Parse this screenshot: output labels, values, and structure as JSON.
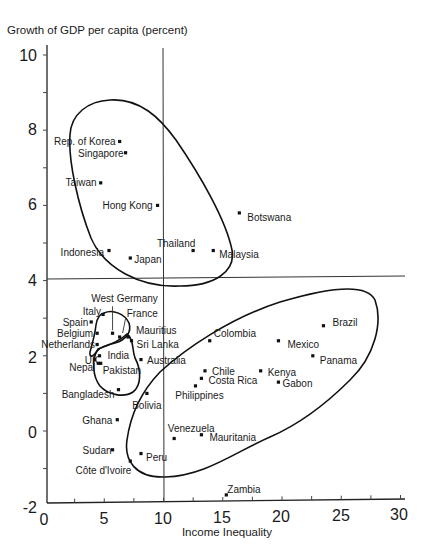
{
  "chart_data": {
    "type": "scatter",
    "title": "Growth of GDP per capita (percent)",
    "xlabel": "Income Inequality",
    "ylabel": "Growth of GDP per capita (percent)",
    "xlim": [
      0,
      30
    ],
    "ylim": [
      -2,
      10
    ],
    "xticks": [
      "0",
      "5",
      "10",
      "15",
      "20",
      "25",
      "30"
    ],
    "yticks": [
      "10",
      "8",
      "6",
      "4",
      "2",
      "0",
      "-2"
    ],
    "grid": false,
    "reference_lines": {
      "vertical_x": 10,
      "horizontal_y": 4
    },
    "marker_color": "#111111",
    "points": [
      {
        "name": "Rep. of Korea",
        "x": 6.3,
        "y": 7.7,
        "dx": -4,
        "dy": 4,
        "anchor": "end"
      },
      {
        "name": "Singapore",
        "x": 6.8,
        "y": 7.4,
        "dx": -2,
        "dy": 4,
        "anchor": "end"
      },
      {
        "name": "Taiwan",
        "x": 4.7,
        "y": 6.6,
        "dx": -4,
        "dy": 3,
        "anchor": "end"
      },
      {
        "name": "Hong Kong",
        "x": 9.5,
        "y": 6.0,
        "dx": -5,
        "dy": 4,
        "anchor": "end"
      },
      {
        "name": "Botswana",
        "x": 16.4,
        "y": 5.8,
        "dx": 8,
        "dy": 8,
        "anchor": "start"
      },
      {
        "name": "Thailand",
        "x": 12.5,
        "y": 4.8,
        "dx": -17,
        "dy": -4,
        "anchor": "middle"
      },
      {
        "name": "Malaysia",
        "x": 14.2,
        "y": 4.8,
        "dx": 6,
        "dy": 7,
        "anchor": "start"
      },
      {
        "name": "Indonesia",
        "x": 5.4,
        "y": 4.8,
        "dx": -5,
        "dy": 5,
        "anchor": "end"
      },
      {
        "name": "Japan",
        "x": 7.2,
        "y": 4.6,
        "dx": 4,
        "dy": 5,
        "anchor": "start"
      },
      {
        "name": "West Germany",
        "x": 5.7,
        "y": 2.6,
        "dx": 12,
        "dy": -31,
        "anchor": "middle",
        "arrow": [
          0,
          -27,
          0,
          -3
        ]
      },
      {
        "name": "Italy",
        "x": 4.9,
        "y": 3.1,
        "dx": -2,
        "dy": 1,
        "anchor": "end"
      },
      {
        "name": "Spain",
        "x": 3.9,
        "y": 2.9,
        "dx": -3,
        "dy": 4,
        "anchor": "end"
      },
      {
        "name": "Belgium",
        "x": 4.4,
        "y": 2.6,
        "dx": -4,
        "dy": 4,
        "anchor": "end"
      },
      {
        "name": "Netherlands",
        "x": 4.4,
        "y": 2.3,
        "dx": -2,
        "dy": 3,
        "anchor": "end"
      },
      {
        "name": "France",
        "x": 6.3,
        "y": 2.5,
        "dx": 7,
        "dy": -20,
        "anchor": "start",
        "arrow": [
          6,
          -19,
          3,
          -4
        ]
      },
      {
        "name": "Mauritius",
        "x": 7.0,
        "y": 2.5,
        "dx": 8,
        "dy": -3,
        "anchor": "start"
      },
      {
        "name": "Sri Lanka",
        "x": 7.3,
        "y": 2.4,
        "dx": 5,
        "dy": 7,
        "anchor": "start"
      },
      {
        "name": "India",
        "x": 4.6,
        "y": 2.0,
        "dx": 8,
        "dy": 3,
        "anchor": "start"
      },
      {
        "name": "UK",
        "x": 4.2,
        "y": 1.9,
        "dx": -10,
        "dy": 4,
        "anchor": "start"
      },
      {
        "name": "Nepal",
        "x": 4.5,
        "y": 1.8,
        "dx": -3,
        "dy": 8,
        "anchor": "end"
      },
      {
        "name": "Pakistan",
        "x": 4.7,
        "y": 1.8,
        "dx": 2,
        "dy": 11,
        "anchor": "start"
      },
      {
        "name": "Australia",
        "x": 8.1,
        "y": 1.9,
        "dx": 6,
        "dy": 4,
        "anchor": "start"
      },
      {
        "name": "Bangladesh",
        "x": 6.2,
        "y": 1.1,
        "dx": -4,
        "dy": 8,
        "anchor": "end"
      },
      {
        "name": "Bolivia",
        "x": 8.6,
        "y": 1.0,
        "dx": 0,
        "dy": 16,
        "anchor": "middle"
      },
      {
        "name": "Ghana",
        "x": 6.1,
        "y": 0.3,
        "dx": -5,
        "dy": 4,
        "anchor": "end"
      },
      {
        "name": "Sudan",
        "x": 5.7,
        "y": -0.5,
        "dx": -1,
        "dy": 4,
        "anchor": "end"
      },
      {
        "name": "Côte d'Ivoire",
        "x": 7.2,
        "y": -0.8,
        "dx": 1,
        "dy": 13,
        "anchor": "end"
      },
      {
        "name": "Peru",
        "x": 8.1,
        "y": -0.6,
        "dx": 5,
        "dy": 7,
        "anchor": "start"
      },
      {
        "name": "Colombia",
        "x": 13.9,
        "y": 2.4,
        "dx": 4,
        "dy": -4,
        "anchor": "start"
      },
      {
        "name": "Mexico",
        "x": 19.7,
        "y": 2.4,
        "dx": 9,
        "dy": 7,
        "anchor": "start"
      },
      {
        "name": "Brazil",
        "x": 23.5,
        "y": 2.8,
        "dx": 9,
        "dy": 0,
        "anchor": "start"
      },
      {
        "name": "Panama",
        "x": 22.6,
        "y": 2.0,
        "dx": 7,
        "dy": 8,
        "anchor": "start"
      },
      {
        "name": "Chile",
        "x": 13.5,
        "y": 1.6,
        "dx": 7,
        "dy": 4,
        "anchor": "start"
      },
      {
        "name": "Costa Rica",
        "x": 13.2,
        "y": 1.4,
        "dx": 7,
        "dy": 6,
        "anchor": "start"
      },
      {
        "name": "Philippines",
        "x": 12.7,
        "y": 1.2,
        "dx": 4,
        "dy": 13,
        "anchor": "middle"
      },
      {
        "name": "Kenya",
        "x": 18.2,
        "y": 1.6,
        "dx": 7,
        "dy": 5,
        "anchor": "start"
      },
      {
        "name": "Gabon",
        "x": 19.7,
        "y": 1.3,
        "dx": 4,
        "dy": 5,
        "anchor": "start"
      },
      {
        "name": "Venezuela",
        "x": 10.9,
        "y": -0.2,
        "dx": 17,
        "dy": -7,
        "anchor": "middle"
      },
      {
        "name": "Mauritania",
        "x": 13.2,
        "y": -0.1,
        "dx": 8,
        "dy": 6,
        "anchor": "start"
      },
      {
        "name": "Zambia",
        "x": 15.3,
        "y": -1.7,
        "dx": 1,
        "dy": -2,
        "anchor": "start"
      }
    ],
    "groups": [
      {
        "name": "high-growth East Asia cluster",
        "members": [
          "Rep. of Korea",
          "Singapore",
          "Taiwan",
          "Hong Kong",
          "Thailand",
          "Indonesia",
          "Japan",
          "Malaysia"
        ]
      },
      {
        "name": "low-inequality Europe cluster",
        "members": [
          "West Germany",
          "Italy",
          "Spain",
          "Belgium",
          "Netherlands",
          "France",
          "UK"
        ]
      },
      {
        "name": "low-inequality South Asia cluster",
        "members": [
          "India",
          "Nepal",
          "Pakistan",
          "Bangladesh",
          "Mauritius",
          "Sri Lanka"
        ]
      },
      {
        "name": "high-inequality low-growth cluster",
        "members": [
          "Brazil",
          "Colombia",
          "Mexico",
          "Panama",
          "Chile",
          "Costa Rica",
          "Philippines",
          "Kenya",
          "Gabon",
          "Venezuela",
          "Mauritania",
          "Peru",
          "Bolivia"
        ]
      }
    ]
  }
}
